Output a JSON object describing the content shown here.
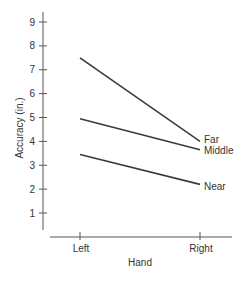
{
  "chart_data": {
    "type": "line",
    "title": "",
    "xlabel": "Hand",
    "ylabel": "Accuracy (in.)",
    "categories": [
      "Left",
      "Right"
    ],
    "yticks": [
      1,
      2,
      3,
      4,
      5,
      6,
      7,
      8,
      9
    ],
    "ylim": [
      0.3,
      9.4
    ],
    "grid": false,
    "legend": "inline labels at right end of lines",
    "series": [
      {
        "name": "Far",
        "values": [
          7.5,
          4.0
        ]
      },
      {
        "name": "Middle",
        "values": [
          4.95,
          3.65
        ]
      },
      {
        "name": "Near",
        "values": [
          3.45,
          2.2
        ]
      }
    ]
  },
  "style": {
    "line_color": "#3a3a3a",
    "axis_color": "#555555",
    "text_color": "#333333"
  }
}
